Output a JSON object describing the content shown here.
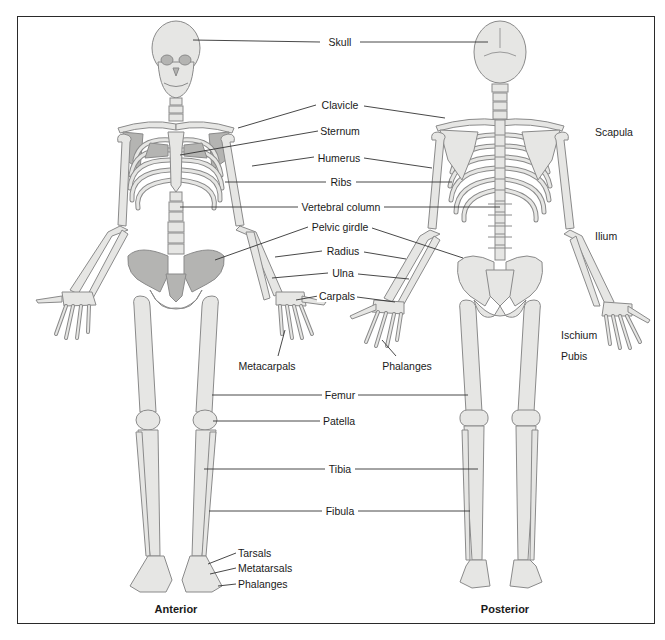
{
  "figure": {
    "type": "anatomical-diagram",
    "views": {
      "anterior": "Anterior",
      "posterior": "Posterior"
    },
    "colors": {
      "bone": "#e6e6e4",
      "bone_outline": "#8a8a8a",
      "bone_shadow": "#a9a9a9",
      "leader_line": "#333333",
      "frame": "#2a2a2a"
    }
  },
  "labels": {
    "skull": "Skull",
    "clavicle": "Clavicle",
    "sternum": "Sternum",
    "humerus": "Humerus",
    "ribs": "Ribs",
    "vertebral_column": "Vertebral column",
    "pelvic_girdle": "Pelvic girdle",
    "radius": "Radius",
    "ulna": "Ulna",
    "carpals": "Carpals",
    "metacarpals": "Metacarpals",
    "phalanges_hand": "Phalanges",
    "femur": "Femur",
    "patella": "Patella",
    "tibia": "Tibia",
    "fibula": "Fibula",
    "tarsals": "Tarsals",
    "metatarsals": "Metatarsals",
    "phalanges_foot": "Phalanges",
    "scapula": "Scapula",
    "ilium": "Ilium",
    "ischium": "Ischium",
    "pubis": "Pubis"
  }
}
